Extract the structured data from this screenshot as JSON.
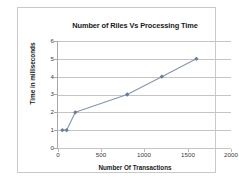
{
  "chart_data": {
    "type": "line",
    "title": "Number of Riles Vs Processing Time",
    "xlabel": "Number Of Transactions",
    "ylabel": "Time in milliseconds",
    "x": [
      50,
      100,
      200,
      800,
      1200,
      1600
    ],
    "values": [
      1,
      1,
      2,
      3,
      4,
      5
    ],
    "series": [
      {
        "name": "Processing Time",
        "x": [
          50,
          100,
          200,
          800,
          1200,
          1600
        ],
        "values": [
          1,
          1,
          2,
          3,
          4,
          5
        ]
      }
    ],
    "xlim": [
      0,
      2000
    ],
    "ylim": [
      0,
      6
    ],
    "xticks": [
      0,
      500,
      1000,
      1500,
      2000
    ],
    "yticks": [
      0,
      1,
      2,
      3,
      4,
      5,
      6
    ],
    "xtick_labels": [
      "0",
      "500",
      "1000",
      "1500",
      "2000"
    ],
    "ytick_labels": [
      "0",
      "1",
      "2",
      "3",
      "4",
      "5",
      "6"
    ],
    "grid": "horizontal",
    "legend": "none",
    "line_color": "#8495ad",
    "marker_color": "#6b7d96",
    "marker_shape": "diamond",
    "grid_color": "#c4c4c4",
    "plot_background": "#ffffff",
    "border_color": "#c9c9c9"
  }
}
